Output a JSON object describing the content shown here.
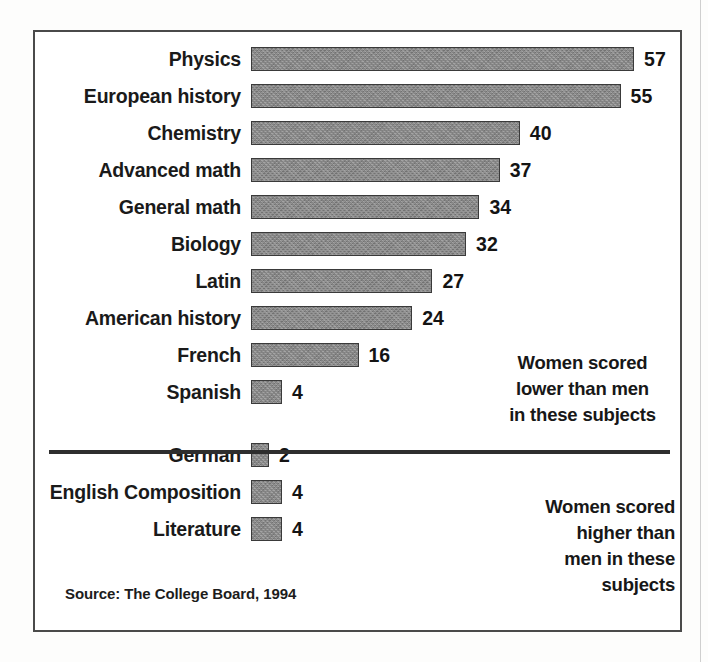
{
  "figure": {
    "source_note": "Source: The College Board, 1994",
    "annotations": {
      "lower": "Women scored lower than men in these subjects",
      "higher": "Women scored higher than men in these subjects"
    }
  },
  "chart_data": {
    "type": "bar",
    "orientation": "horizontal",
    "title": "",
    "xlabel": "",
    "ylabel": "",
    "xlim": [
      0,
      57
    ],
    "grid": false,
    "legend": null,
    "axis_visible": false,
    "value_labels": true,
    "bar_color": "#8a8a8a",
    "bar_border_color": "#3a3a3a",
    "groups": [
      {
        "name": "Women scored lower than men in these subjects",
        "annotation_lines": [
          "Women scored",
          "lower than men",
          "in these subjects"
        ],
        "categories": [
          "Physics",
          "European history",
          "Chemistry",
          "Advanced math",
          "General math",
          "Biology",
          "Latin",
          "American history",
          "French",
          "Spanish"
        ],
        "values": [
          57,
          55,
          40,
          37,
          34,
          32,
          27,
          24,
          16,
          4
        ]
      },
      {
        "name": "Women scored higher than men in these subjects",
        "annotation_lines": [
          "Women scored",
          "higher than",
          "men in these",
          "subjects"
        ],
        "categories": [
          "German",
          "English Composition",
          "Literature"
        ],
        "values": [
          2,
          4,
          4
        ]
      }
    ]
  }
}
